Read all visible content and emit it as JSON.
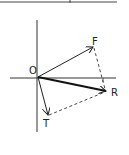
{
  "diagram": {
    "type": "vector-addition",
    "origin": {
      "label": "O",
      "x": 38,
      "y": 77
    },
    "axes": {
      "horizontal": {
        "x1": 10,
        "x2": 116,
        "y": 78
      },
      "vertical": {
        "x": 37,
        "y1": 20,
        "y2": 132
      }
    },
    "vectors": [
      {
        "name": "F",
        "label": "F",
        "tip": {
          "x": 93,
          "y": 47
        },
        "style": "solid"
      },
      {
        "name": "R",
        "label": "R",
        "tip": {
          "x": 106,
          "y": 91
        },
        "style": "bold"
      },
      {
        "name": "T",
        "label": "T",
        "tip": {
          "x": 48,
          "y": 115
        },
        "style": "solid"
      }
    ],
    "construction_lines": [
      {
        "from": "F",
        "to": "R",
        "style": "dashed"
      },
      {
        "from": "T",
        "to": "R",
        "style": "dashed"
      }
    ],
    "colors": {
      "ink": "#222222",
      "background": "#ffffff"
    }
  },
  "labels": {
    "origin": "O",
    "F": "F",
    "R": "R",
    "T": "T"
  }
}
